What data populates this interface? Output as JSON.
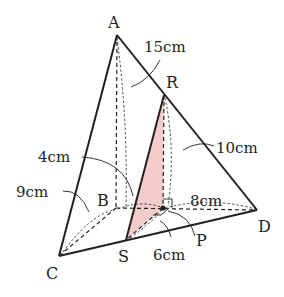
{
  "figure": {
    "type": "triangular pyramid with shaded cross-section",
    "colors": {
      "line": "#231f20",
      "shade": "#f4cccc"
    },
    "vertices": {
      "A": "A",
      "B": "B",
      "C": "C",
      "D": "D",
      "R": "R",
      "S": "S",
      "P": "P"
    },
    "labels": {
      "AB": "15cm",
      "RP": "10cm",
      "BP_arc": "4cm",
      "BC": "9cm",
      "PD": "8cm",
      "SP": "6cm"
    }
  }
}
